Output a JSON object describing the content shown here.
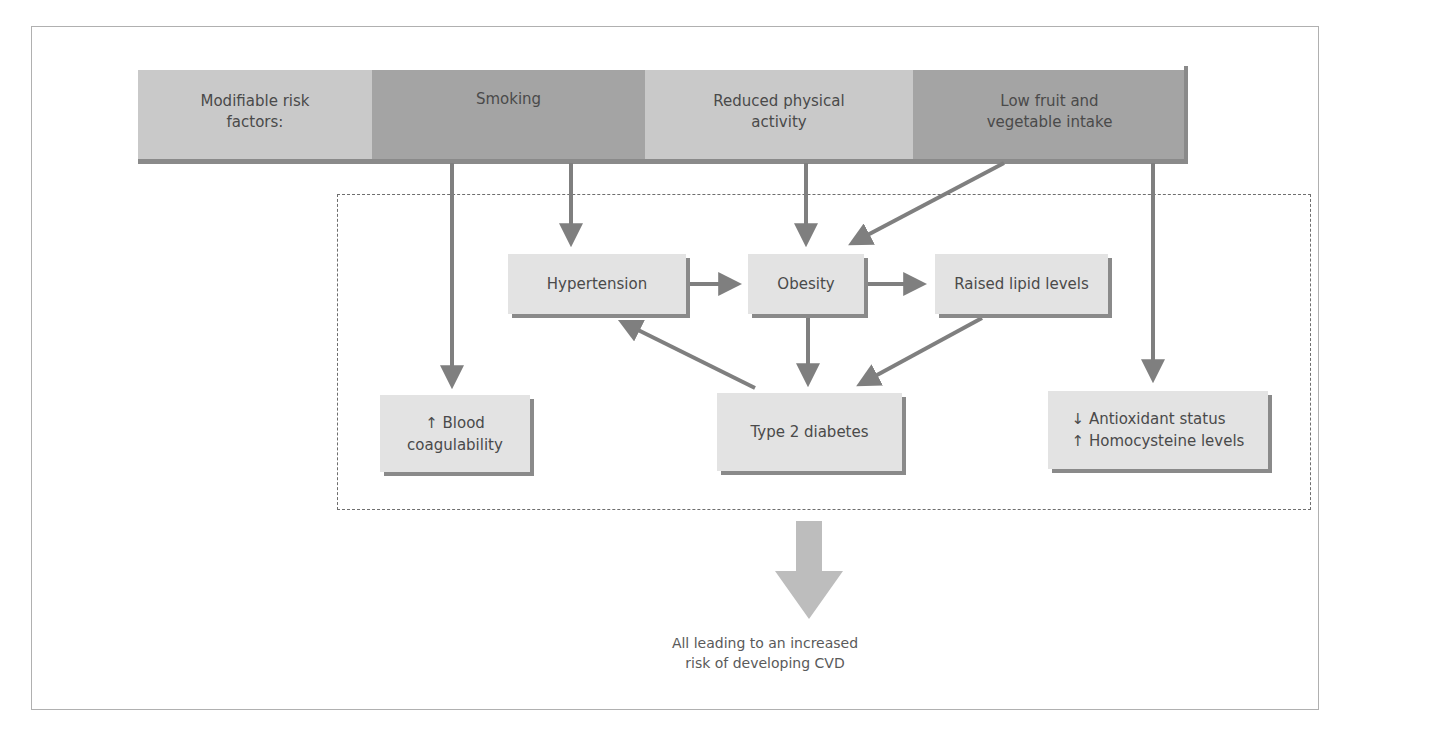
{
  "diagram": {
    "title_label": "Modifiable risk factors:",
    "risk_factors": [
      {
        "label": "Smoking"
      },
      {
        "label": "Reduced physical activity"
      },
      {
        "label": "Low fruit and vegetable intake"
      }
    ],
    "top_bar_lines": {
      "title_line1": "Modifiable risk",
      "title_line2": "factors:",
      "smoking": "Smoking",
      "activity_line1": "Reduced physical",
      "activity_line2": "activity",
      "fruit_line1": "Low fruit and",
      "fruit_line2": "vegetable intake"
    },
    "nodes": {
      "hypertension": "Hypertension",
      "obesity": "Obesity",
      "lipids": "Raised lipid levels",
      "coagulability_line1": "↑ Blood",
      "coagulability_line2": "coagulability",
      "diabetes": "Type 2 diabetes",
      "antioxidant_line1": "↓ Antioxidant status",
      "antioxidant_line2": "↑ Homocysteine levels"
    },
    "edges": [
      {
        "from": "Smoking",
        "to": "↑ Blood coagulability"
      },
      {
        "from": "Smoking",
        "to": "Hypertension"
      },
      {
        "from": "Reduced physical activity",
        "to": "Obesity"
      },
      {
        "from": "Low fruit and vegetable intake",
        "to": "Obesity"
      },
      {
        "from": "Low fruit and vegetable intake",
        "to": "↓ Antioxidant status / ↑ Homocysteine levels"
      },
      {
        "from": "Hypertension",
        "to": "Obesity"
      },
      {
        "from": "Obesity",
        "to": "Raised lipid levels"
      },
      {
        "from": "Obesity",
        "to": "Type 2 diabetes"
      },
      {
        "from": "Raised lipid levels",
        "to": "Type 2 diabetes"
      },
      {
        "from": "Type 2 diabetes",
        "to": "Hypertension"
      }
    ],
    "outcome_line1": "All leading to an increased",
    "outcome_line2": "risk of developing CVD",
    "colors": {
      "light_segment": "#c9c9c9",
      "dark_segment": "#a4a4a4",
      "node_fill": "#e3e3e3",
      "arrow": "#7f7f7f",
      "big_arrow": "#bdbdbd"
    }
  }
}
